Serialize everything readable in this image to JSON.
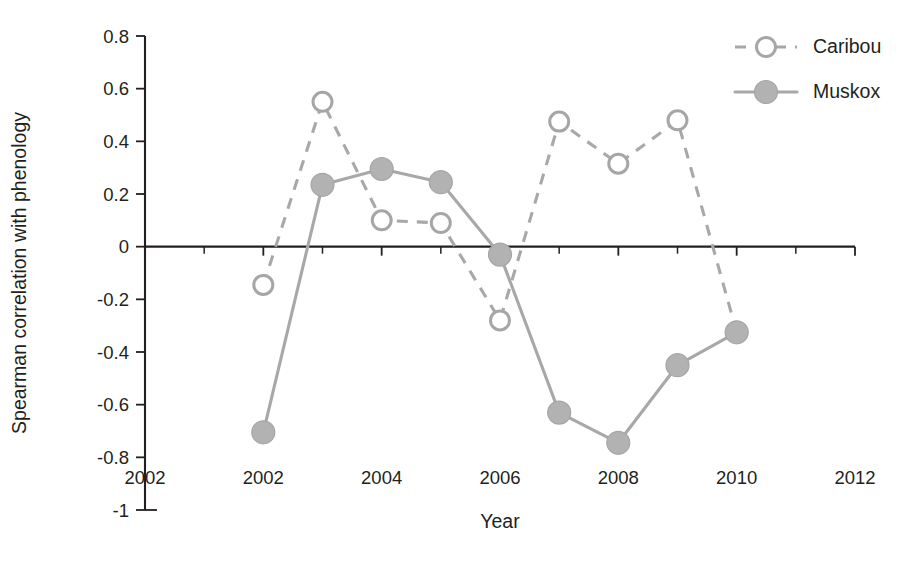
{
  "chart_data": {
    "type": "line",
    "title": "",
    "xlabel": "Year",
    "ylabel": "Spearman correlation with phenology",
    "xlim": [
      2000,
      2012
    ],
    "ylim": [
      -1,
      0.8
    ],
    "grid": false,
    "legend_position": "top-right",
    "x": [
      2002,
      2003,
      2004,
      2005,
      2006,
      2007,
      2008,
      2009,
      2010
    ],
    "y_ticks": [
      "0.8",
      "0.6",
      "0.4",
      "0.2",
      "0",
      "-0.2",
      "-0.4",
      "-0.6",
      "-0.8",
      "-1"
    ],
    "y_tick_values": [
      0.8,
      0.6,
      0.4,
      0.2,
      0,
      -0.2,
      -0.4,
      -0.6,
      -0.8,
      -1
    ],
    "x_ticks": [
      "2002",
      "2002",
      "2004",
      "2006",
      "2008",
      "2010",
      "2012"
    ],
    "x_tick_values": [
      2000,
      2002,
      2004,
      2006,
      2008,
      2010,
      2012
    ],
    "zero_line": 0,
    "series": [
      {
        "name": "Caribou",
        "marker": "open-circle",
        "line_style": "dashed",
        "color": "#a8a8a8",
        "x": [
          2002,
          2003,
          2004,
          2005,
          2006,
          2007,
          2008,
          2009,
          2010
        ],
        "values": [
          -0.145,
          0.55,
          0.1,
          0.09,
          -0.28,
          0.475,
          0.315,
          0.48,
          -0.325
        ]
      },
      {
        "name": "Muskox",
        "marker": "filled-circle",
        "line_style": "solid",
        "color": "#b2b2b2",
        "x": [
          2002,
          2003,
          2004,
          2005,
          2006,
          2007,
          2008,
          2009,
          2010
        ],
        "values": [
          -0.705,
          0.235,
          0.295,
          0.245,
          -0.03,
          -0.63,
          -0.745,
          -0.45,
          -0.325
        ]
      }
    ]
  },
  "legend": {
    "entries": [
      {
        "label": "Caribou"
      },
      {
        "label": "Muskox"
      }
    ]
  },
  "axes": {
    "y_title": "Spearman correlation with phenology",
    "x_title": "Year"
  }
}
